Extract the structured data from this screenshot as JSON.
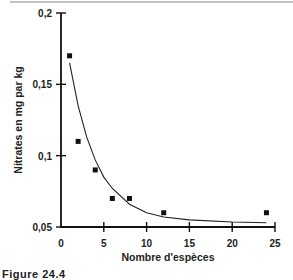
{
  "chart_data": {
    "type": "scatter",
    "title": "",
    "xlabel": "Nombre d'espèces",
    "ylabel": "Nitrates en mg par kg",
    "xlim": [
      0,
      25
    ],
    "ylim": [
      0.05,
      0.2
    ],
    "x_ticks": [
      0,
      5,
      10,
      15,
      20,
      25
    ],
    "x_tick_labels": [
      "0",
      "5",
      "10",
      "15",
      "20",
      "25"
    ],
    "y_ticks": [
      0.05,
      0.1,
      0.15,
      0.2
    ],
    "y_tick_labels": [
      "0,05",
      "0,1",
      "0,15",
      "0,2"
    ],
    "grid": false,
    "legend": null,
    "series": [
      {
        "name": "observations",
        "kind": "scatter",
        "marker": "square",
        "x": [
          1,
          2,
          4,
          6,
          8,
          12,
          24
        ],
        "y": [
          0.17,
          0.11,
          0.09,
          0.07,
          0.07,
          0.06,
          0.06
        ]
      },
      {
        "name": "fitted curve",
        "kind": "line",
        "description": "exponential decay fit",
        "x": [
          1,
          2,
          3,
          4,
          5,
          6,
          8,
          10,
          12,
          15,
          20,
          24
        ],
        "y": [
          0.165,
          0.135,
          0.113,
          0.097,
          0.085,
          0.077,
          0.066,
          0.06,
          0.057,
          0.055,
          0.0535,
          0.053
        ]
      }
    ]
  },
  "caption": {
    "text": "Figure 24.4"
  }
}
